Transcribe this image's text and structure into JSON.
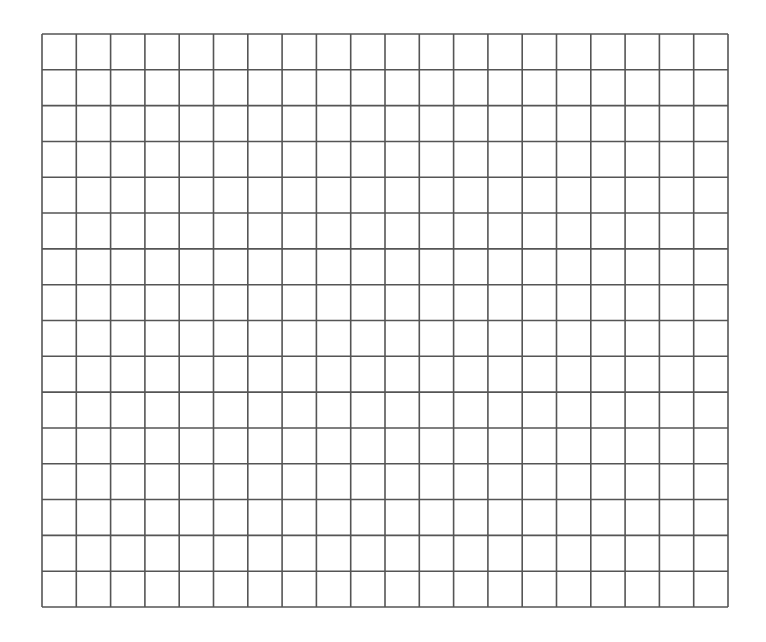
{
  "grid": {
    "columns": 20,
    "rows": 16,
    "left": 41,
    "top": 33,
    "width": 686,
    "height": 573,
    "line_color": "#555555",
    "line_width": 1.6,
    "background": "#ffffff"
  }
}
